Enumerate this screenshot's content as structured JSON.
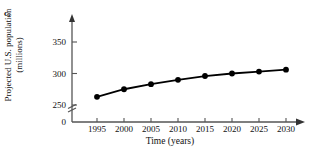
{
  "figure": {
    "part_label": "c.",
    "xlabel": "Time (years)",
    "ylabel_line1": "Projected U.S. population",
    "ylabel_line2": "(millions)"
  },
  "chart_data": {
    "type": "line",
    "title": "",
    "xlabel": "Time (years)",
    "ylabel": "Projected U.S. population (millions)",
    "x": [
      1995,
      2000,
      2005,
      2010,
      2015,
      2020,
      2025,
      2030
    ],
    "xtick_labels": [
      "1995",
      "2000",
      "2005",
      "2010",
      "2015",
      "2020",
      "2025",
      "2030"
    ],
    "values": [
      263,
      275,
      283,
      290,
      296,
      300,
      303,
      306
    ],
    "ytick_labels": [
      "0",
      "250",
      "300",
      "350"
    ],
    "ytick_values": [
      0,
      250,
      300,
      350
    ],
    "ylim": [
      250,
      360
    ],
    "xlim": [
      1993,
      2032
    ],
    "axis_break": true,
    "axis_break_between": [
      0,
      250
    ],
    "grid": false,
    "legend": "none",
    "marker": "filled-circle",
    "line_color": "#000000",
    "marker_color": "#000000",
    "axis_color": "#555555"
  }
}
